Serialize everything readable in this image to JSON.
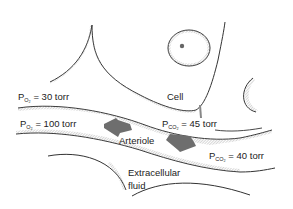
{
  "diagram": {
    "labels": {
      "po2_tissue": {
        "prefix": "P",
        "sub": "O₂",
        "rest": " = 30 torr"
      },
      "po2_arteriole": {
        "prefix": "P",
        "sub": "O₂",
        "rest": " = 100 torr"
      },
      "pco2_tissue": {
        "prefix": "P",
        "sub": "CO₂",
        "rest": " = 45 torr"
      },
      "pco2_arteriole": {
        "prefix": "P",
        "sub": "CO₂",
        "rest": " = 40 torr"
      },
      "cell": "Cell",
      "arteriole": "Arteriole",
      "extracellular_1": "Extracellular",
      "extracellular_2": "fluid"
    },
    "arrows": [
      {
        "name": "o2-diffusion-arrow",
        "direction": "arteriole-to-cell"
      },
      {
        "name": "co2-diffusion-arrow",
        "direction": "cell-to-arteriole"
      }
    ],
    "colors": {
      "line": "#333333",
      "arrow": "#6e6e6e",
      "hatch": "#888888"
    }
  }
}
